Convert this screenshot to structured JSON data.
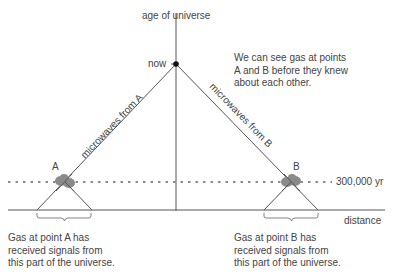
{
  "diagram": {
    "y_axis_label": "age of universe",
    "x_axis_label": "distance",
    "now_label": "now",
    "time_marker_label": "300,000 yr",
    "point_a_label": "A",
    "point_b_label": "B",
    "ray_a_label": "microwaves from A",
    "ray_b_label": "microwaves from B",
    "note": "We can see gas at points A and B before they knew about each other.",
    "note_lines": [
      "We can see gas at points",
      "A and B before they knew",
      "about each other."
    ],
    "caption_a_lines": [
      "Gas at point A has",
      "received signals from",
      "this part of the universe."
    ],
    "caption_b_lines": [
      "Gas at point B has",
      "received signals from",
      "this part of the universe."
    ],
    "colors": {
      "line": "#555555",
      "blob": "#8a8a8a",
      "text": "#444444"
    }
  }
}
